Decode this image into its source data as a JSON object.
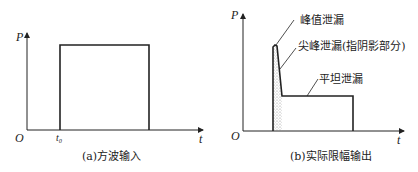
{
  "figure_a": {
    "caption": "(a)方波输入",
    "y_axis_label": "P",
    "x_axis_label": "t",
    "origin_label": "O",
    "start_label": "t₀"
  },
  "figure_b": {
    "caption": "(b)实际限幅输出",
    "y_axis_label": "P",
    "x_axis_label": "t",
    "origin_label": "O",
    "annotations": [
      "峰值泄漏",
      "尖峰泄漏(指阴影部分)",
      "平坦泄漏"
    ]
  },
  "colors": {
    "line": "#222222",
    "shade": "#999999",
    "background": "#ffffff"
  }
}
